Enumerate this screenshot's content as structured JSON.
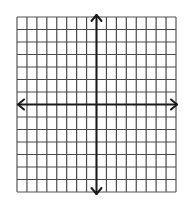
{
  "diagram": {
    "type": "coordinate-plane",
    "grid": {
      "columns": 16,
      "rows": 14,
      "left": 17,
      "top": 17,
      "cell_width": 9.9375,
      "cell_height": 12.5,
      "line_color": "#4a4a4a",
      "border_color": "#555555"
    },
    "axes": {
      "x_axis_row_index": 7,
      "y_axis_col_index": 8,
      "color": "#1a1a1a",
      "arrowheads": [
        "left",
        "right",
        "up",
        "down"
      ]
    },
    "background": "#ffffff"
  }
}
